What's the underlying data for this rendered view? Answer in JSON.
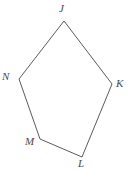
{
  "figure": {
    "kind": "geometry-polygon",
    "name": "pentagon-JKLMN",
    "background_color": "#ffffff",
    "stroke_color": "#5a5a5a",
    "stroke_width": 1,
    "label_color": "#4a4a4a",
    "canvas": {
      "width": 129,
      "height": 170
    },
    "vertices": [
      {
        "id": "J",
        "label": "J",
        "x": 64,
        "y": 21,
        "label_x": 59,
        "label_y": 3
      },
      {
        "id": "K",
        "label": "K",
        "x": 112,
        "y": 84,
        "label_x": 116,
        "label_y": 78
      },
      {
        "id": "L",
        "label": "L",
        "x": 82,
        "y": 157,
        "label_x": 78,
        "label_y": 158
      },
      {
        "id": "M",
        "label": "M",
        "x": 40,
        "y": 139,
        "label_x": 25,
        "label_y": 136
      },
      {
        "id": "N",
        "label": "N",
        "x": 19,
        "y": 79,
        "label_x": 2,
        "label_y": 71
      }
    ],
    "edges": [
      {
        "from": "J",
        "to": "K"
      },
      {
        "from": "K",
        "to": "L"
      },
      {
        "from": "L",
        "to": "M"
      },
      {
        "from": "M",
        "to": "N"
      },
      {
        "from": "N",
        "to": "J"
      }
    ]
  }
}
